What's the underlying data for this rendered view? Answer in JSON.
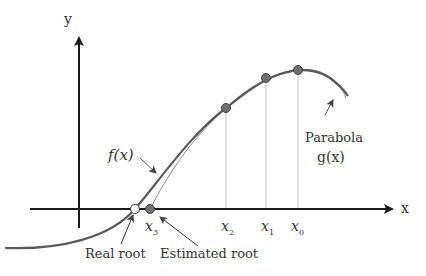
{
  "diagram": {
    "axes": {
      "x_label": "x",
      "y_label": "y"
    },
    "curves": {
      "f": {
        "label": "f(x)"
      },
      "g": {
        "label_line1": "Parabola",
        "label_line2": "g(x)"
      }
    },
    "points": [
      {
        "id": "x0",
        "label": "x",
        "sub": "0"
      },
      {
        "id": "x1",
        "label": "x",
        "sub": "1"
      },
      {
        "id": "x2",
        "label": "x",
        "sub": "2"
      },
      {
        "id": "x3",
        "label": "x",
        "sub": "3"
      }
    ],
    "annotations": {
      "real_root": "Real root",
      "estimated_root": "Estimated root"
    },
    "colors": {
      "axis": "#1a1a1a",
      "curve": "#555555",
      "point_fill": "#707070",
      "guide": "#bbbbbb",
      "text": "#333333"
    }
  }
}
